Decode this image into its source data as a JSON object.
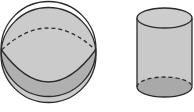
{
  "figure": {
    "shapes": [
      {
        "name": "sphere",
        "label": ""
      },
      {
        "name": "cylinder",
        "label": ""
      }
    ],
    "colors": {
      "background": "#ffffff",
      "fill_light": "#c9c9c9",
      "fill_dark": "#a9a9a9",
      "stroke": "#2b2b2b"
    }
  }
}
